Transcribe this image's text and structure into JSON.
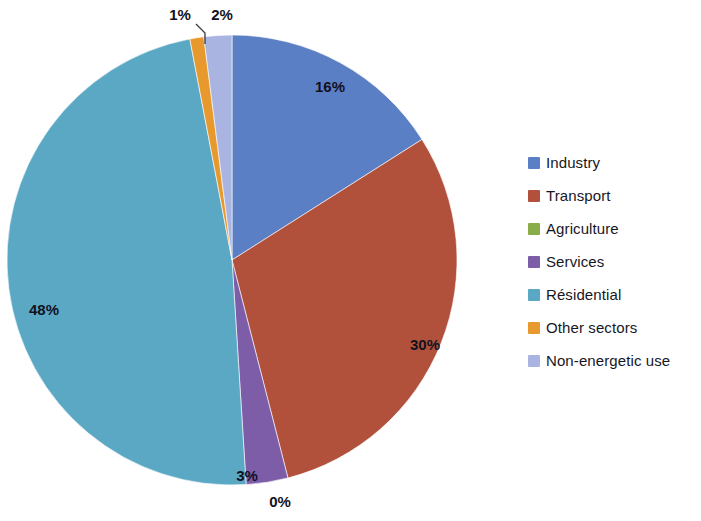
{
  "chart_data": {
    "type": "pie",
    "title": "",
    "subtitle": "",
    "xlabel": "",
    "ylabel": "",
    "legend_position": "right",
    "grid": false,
    "start_angle_deg": 0,
    "direction": "clockwise",
    "categories": [
      "Industry",
      "Transport",
      "Agriculture",
      "Services",
      "Résidential",
      "Other sectors",
      "Non-energetic use"
    ],
    "values": [
      16,
      30,
      0,
      3,
      48,
      1,
      2
    ],
    "data_labels": [
      "16%",
      "30%",
      "0%",
      "3%",
      "48%",
      "1%",
      "2%"
    ],
    "colors": [
      "#5b7fc4",
      "#b1513c",
      "#8aad4a",
      "#7d5da8",
      "#5ba8c4",
      "#e8992e",
      "#aab4e0"
    ],
    "slices": [
      {
        "name": "Industry",
        "value": 16,
        "label": "16%",
        "color": "#5b7fc4"
      },
      {
        "name": "Transport",
        "value": 30,
        "label": "30%",
        "color": "#b1513c"
      },
      {
        "name": "Agriculture",
        "value": 0,
        "label": "0%",
        "color": "#8aad4a"
      },
      {
        "name": "Services",
        "value": 3,
        "label": "3%",
        "color": "#7d5da8"
      },
      {
        "name": "Résidential",
        "value": 48,
        "label": "48%",
        "color": "#5ba8c4"
      },
      {
        "name": "Other sectors",
        "value": 1,
        "label": "1%",
        "color": "#e8992e"
      },
      {
        "name": "Non-energetic use",
        "value": 2,
        "label": "2%",
        "color": "#aab4e0"
      }
    ]
  },
  "legend": {
    "items": [
      {
        "label": "Industry",
        "color": "#5b7fc4"
      },
      {
        "label": "Transport",
        "color": "#b1513c"
      },
      {
        "label": "Agriculture",
        "color": "#8aad4a"
      },
      {
        "label": "Services",
        "color": "#7d5da8"
      },
      {
        "label": "Résidential",
        "color": "#5ba8c4"
      },
      {
        "label": "Other sectors",
        "color": "#e8992e"
      },
      {
        "label": "Non-energetic use",
        "color": "#aab4e0"
      }
    ]
  },
  "labels": {
    "industry": "16%",
    "transport": "30%",
    "agriculture": "0%",
    "services": "3%",
    "residential": "48%",
    "other_sectors": "1%",
    "non_energetic_use": "2%"
  },
  "geometry": {
    "center_x": 232,
    "center_y": 260,
    "radius": 225
  }
}
